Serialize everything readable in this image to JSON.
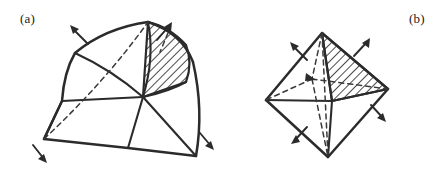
{
  "figure": {
    "background_color": "#ffffff",
    "ink_color": "#2b2b2b",
    "width": 448,
    "height": 171,
    "panels": [
      {
        "key": "a",
        "label": "(a)",
        "label_position": {
          "x": 20,
          "y": 11
        },
        "description": "curved spherical triangulated patch with one hatched curved quadrilateral face",
        "shape_type": "curved-triangulated-patch",
        "hatched_faces": 1,
        "outward_arrows": 4,
        "hidden_dashed_edges": 2
      },
      {
        "key": "b",
        "label": "(b)",
        "label_position": {
          "x": 409,
          "y": 11
        },
        "description": "octahedron with one hatched triangular face",
        "shape_type": "octahedron",
        "hatched_faces": 1,
        "outward_arrows": 4,
        "hidden_dashed_edges": 4
      }
    ]
  },
  "panel_a": {
    "vertices": {
      "top": {
        "x": 148,
        "y": 22
      },
      "upper_left": {
        "x": 75,
        "y": 53
      },
      "left": {
        "x": 62,
        "y": 101
      },
      "bottom_left": {
        "x": 44,
        "y": 139
      },
      "bottom_mid": {
        "x": 128,
        "y": 148
      },
      "right": {
        "x": 196,
        "y": 156
      },
      "mid_right": {
        "x": 186,
        "y": 82
      },
      "center": {
        "x": 143,
        "y": 97
      }
    },
    "hatch_angle_deg": 45,
    "hatch_spacing_px": 6,
    "arrows": [
      {
        "name": "arrow-upper-left",
        "x": 78,
        "y": 30,
        "angle_deg": 215
      },
      {
        "name": "arrow-upper-right",
        "x": 166,
        "y": 28,
        "angle_deg": 325
      },
      {
        "name": "arrow-lower-left",
        "x": 44,
        "y": 152,
        "angle_deg": 120
      },
      {
        "name": "arrow-lower-right",
        "x": 208,
        "y": 143,
        "angle_deg": 50
      }
    ]
  },
  "panel_b": {
    "vertices": {
      "top": {
        "x": 322,
        "y": 33
      },
      "left": {
        "x": 266,
        "y": 100
      },
      "right": {
        "x": 388,
        "y": 89
      },
      "bottom": {
        "x": 328,
        "y": 157
      },
      "front": {
        "x": 332,
        "y": 101
      },
      "back": {
        "x": 312,
        "y": 79
      }
    },
    "hatch_angle_deg": 45,
    "hatch_spacing_px": 6,
    "arrows": [
      {
        "name": "arrow-upper-left",
        "x": 293,
        "y": 47,
        "angle_deg": 215
      },
      {
        "name": "arrow-upper-right",
        "x": 366,
        "y": 42,
        "angle_deg": 325
      },
      {
        "name": "arrow-lower-left",
        "x": 294,
        "y": 139,
        "angle_deg": 125
      },
      {
        "name": "arrow-lower-right",
        "x": 382,
        "y": 117,
        "angle_deg": 55
      }
    ]
  }
}
